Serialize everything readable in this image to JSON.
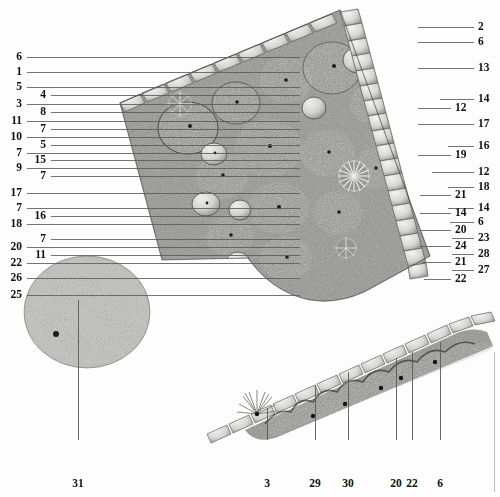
{
  "figure": {
    "kind": "botanical-planting-plan",
    "background_color": "#fdfdfd",
    "line_color": "#5a5a5a",
    "label_color": "#111111"
  },
  "callouts": {
    "left": [
      {
        "n": "6",
        "y": 57,
        "x": 22,
        "line_to": 300
      },
      {
        "n": "1",
        "y": 72,
        "x": 22,
        "line_to": 300
      },
      {
        "n": "5",
        "y": 87,
        "x": 22,
        "line_to": 300
      },
      {
        "n": "4",
        "y": 95,
        "x": 46,
        "line_to": 300
      },
      {
        "n": "3",
        "y": 104,
        "x": 22,
        "line_to": 300
      },
      {
        "n": "8",
        "y": 112,
        "x": 46,
        "line_to": 300
      },
      {
        "n": "11",
        "y": 121,
        "x": 22,
        "line_to": 300
      },
      {
        "n": "7",
        "y": 129,
        "x": 46,
        "line_to": 300
      },
      {
        "n": "10",
        "y": 137,
        "x": 22,
        "line_to": 300
      },
      {
        "n": "5",
        "y": 145,
        "x": 46,
        "line_to": 300
      },
      {
        "n": "7",
        "y": 153,
        "x": 22,
        "line_to": 300
      },
      {
        "n": "15",
        "y": 160,
        "x": 46,
        "line_to": 300
      },
      {
        "n": "9",
        "y": 168,
        "x": 22,
        "line_to": 300
      },
      {
        "n": "7",
        "y": 176,
        "x": 46,
        "line_to": 300
      },
      {
        "n": "17",
        "y": 193,
        "x": 22,
        "line_to": 300
      },
      {
        "n": "7",
        "y": 208,
        "x": 22,
        "line_to": 300
      },
      {
        "n": "16",
        "y": 216,
        "x": 46,
        "line_to": 300
      },
      {
        "n": "18",
        "y": 224,
        "x": 22,
        "line_to": 300
      },
      {
        "n": "7",
        "y": 239,
        "x": 46,
        "line_to": 300
      },
      {
        "n": "20",
        "y": 247,
        "x": 22,
        "line_to": 300
      },
      {
        "n": "11",
        "y": 255,
        "x": 46,
        "line_to": 300
      },
      {
        "n": "22",
        "y": 263,
        "x": 22,
        "line_to": 300
      },
      {
        "n": "26",
        "y": 278,
        "x": 22,
        "line_to": 300
      },
      {
        "n": "25",
        "y": 295,
        "x": 22,
        "line_to": 300
      }
    ],
    "right": [
      {
        "n": "2",
        "y": 27,
        "x": 478,
        "line_from": 418
      },
      {
        "n": "6",
        "y": 42,
        "x": 478,
        "line_from": 418
      },
      {
        "n": "13",
        "y": 68,
        "x": 478,
        "line_from": 418
      },
      {
        "n": "14",
        "y": 99,
        "x": 478,
        "line_from": 440
      },
      {
        "n": "12",
        "y": 108,
        "x": 455,
        "line_from": 418
      },
      {
        "n": "17",
        "y": 124,
        "x": 478,
        "line_from": 418
      },
      {
        "n": "16",
        "y": 146,
        "x": 478,
        "line_from": 448
      },
      {
        "n": "19",
        "y": 155,
        "x": 455,
        "line_from": 418
      },
      {
        "n": "12",
        "y": 172,
        "x": 478,
        "line_from": 432
      },
      {
        "n": "18",
        "y": 187,
        "x": 478,
        "line_from": 448
      },
      {
        "n": "21",
        "y": 195,
        "x": 455,
        "line_from": 420
      },
      {
        "n": "14",
        "y": 208,
        "x": 478,
        "line_from": 448
      },
      {
        "n": "14",
        "y": 213,
        "x": 455,
        "line_from": 420
      },
      {
        "n": "6",
        "y": 222,
        "x": 478,
        "line_from": 450
      },
      {
        "n": "20",
        "y": 230,
        "x": 455,
        "line_from": 420
      },
      {
        "n": "23",
        "y": 238,
        "x": 478,
        "line_from": 452
      },
      {
        "n": "24",
        "y": 246,
        "x": 455,
        "line_from": 420
      },
      {
        "n": "28",
        "y": 254,
        "x": 478,
        "line_from": 452
      },
      {
        "n": "21",
        "y": 262,
        "x": 455,
        "line_from": 422
      },
      {
        "n": "27",
        "y": 270,
        "x": 478,
        "line_from": 452
      },
      {
        "n": "22",
        "y": 279,
        "x": 455,
        "line_from": 424
      }
    ],
    "bottom": [
      {
        "n": "31",
        "x": 78,
        "y": 478,
        "line_from": 440,
        "line_to": 300
      },
      {
        "n": "3",
        "x": 267,
        "y": 478,
        "line_from": 440,
        "line_to": 408
      },
      {
        "n": "29",
        "x": 315,
        "y": 478,
        "line_from": 440,
        "line_to": 385
      },
      {
        "n": "30",
        "x": 348,
        "y": 478,
        "line_from": 440,
        "line_to": 372
      },
      {
        "n": "20",
        "x": 396,
        "y": 478,
        "line_from": 440,
        "line_to": 358
      },
      {
        "n": "22",
        "x": 412,
        "y": 478,
        "line_from": 440,
        "line_to": 352
      },
      {
        "n": "6",
        "x": 440,
        "y": 478,
        "line_from": 440,
        "line_to": 342
      }
    ]
  },
  "beds": {
    "main": {
      "name": "main-wedge-bed",
      "label": "Large triangular raised bed with stone edging"
    },
    "round": {
      "name": "round-island-bed",
      "label": "Round island bed"
    },
    "strip": {
      "name": "linear-strip-bed",
      "label": "Narrow linear border strip along stone edging"
    }
  }
}
